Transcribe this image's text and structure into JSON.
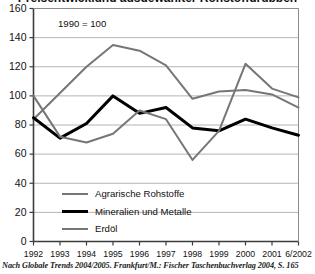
{
  "figure": {
    "title_cropped": "Preisentwicklung ausgewählter Rohstoffgruppen",
    "annotation": "1990 = 100",
    "source": "Nach Globale Trends 2004/2005. Frankfurt/M.: Fischer Taschenbuchverlag 2004, S. 165"
  },
  "colors": {
    "series_gray": "#767676",
    "series_black": "#000000",
    "grid": "#b4b4b4",
    "axis": "#3c3c3c",
    "background": "#ffffff",
    "text": "#111111"
  },
  "chart_data": {
    "type": "line",
    "title": "Preisentwicklung ausgewählter Rohstoffgruppen",
    "subtitle": "1990 = 100",
    "xlabel": "",
    "ylabel": "",
    "ylim": [
      0,
      160
    ],
    "yticks": [
      0,
      20,
      40,
      60,
      80,
      100,
      120,
      140,
      160
    ],
    "grid": true,
    "grid_axis": "y",
    "legend_position": "inside-lower-left",
    "categories": [
      "1992",
      "1993",
      "1994",
      "1995",
      "1996",
      "1997",
      "1998",
      "1999",
      "2000",
      "2001",
      "6/2002"
    ],
    "series": [
      {
        "name": "Agrarische Rohstoffe",
        "color": "#767676",
        "width": 2,
        "values": [
          84,
          102,
          120,
          135,
          131,
          121,
          98,
          103,
          104,
          101,
          92
        ]
      },
      {
        "name": "Mineralien und Metalle",
        "color": "#000000",
        "width": 3,
        "values": [
          85,
          71,
          81,
          100,
          88,
          92,
          78,
          76,
          84,
          78,
          73
        ]
      },
      {
        "name": "Erdöl",
        "color": "#767676",
        "width": 2,
        "values": [
          100,
          72,
          68,
          74,
          90,
          84,
          56,
          76,
          122,
          105,
          99
        ]
      }
    ]
  },
  "axes": {
    "y_tick_labels": [
      "160",
      "140",
      "120",
      "100",
      "80",
      "60",
      "40",
      "20",
      "0"
    ],
    "x_tick_labels": [
      "1992",
      "1993",
      "1994",
      "1995",
      "1996",
      "1997",
      "1998",
      "1999",
      "2000",
      "2001",
      "6/2002"
    ]
  },
  "legend": {
    "entries": [
      {
        "label": "Agrarische Rohstoffe",
        "color": "#767676",
        "width": 2
      },
      {
        "label": "Mineralien und Metalle",
        "color": "#000000",
        "width": 3
      },
      {
        "label": "Erdöl",
        "color": "#767676",
        "width": 2
      }
    ]
  }
}
